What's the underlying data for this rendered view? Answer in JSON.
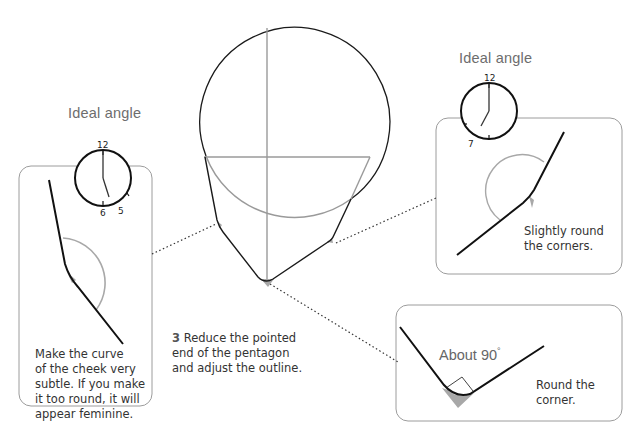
{
  "left_panel": {
    "title": "Ideal angle",
    "clock_labels": [
      "12",
      "6",
      "5"
    ],
    "caption_lines": [
      "Make the curve",
      "of the cheek very",
      "subtle. If you make",
      "it too round, it will",
      "appear feminine."
    ]
  },
  "center": {
    "step_number": "3",
    "caption_lines": [
      "Reduce the pointed",
      "end of the pentagon",
      "and adjust the outline."
    ]
  },
  "right_top_panel": {
    "title": "Ideal angle",
    "clock_labels": [
      "12",
      "7"
    ],
    "caption_lines": [
      "Slightly round",
      "the corners."
    ]
  },
  "right_bottom_panel": {
    "angle_label": "About 90",
    "degree_symbol": "°",
    "caption_lines": [
      "Round the",
      "corner."
    ]
  },
  "colors": {
    "outline": "#1a1a1a",
    "guide": "#9a9a9a",
    "panel_border": "#9c9c9c",
    "shadow_fill": "#a8a8a8"
  }
}
